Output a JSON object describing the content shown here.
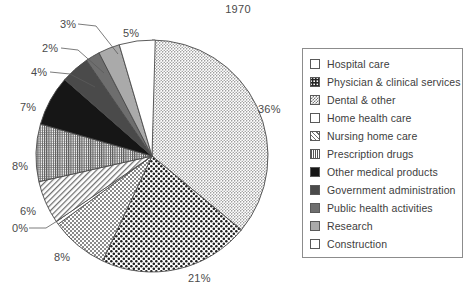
{
  "chart_data": {
    "type": "pie",
    "title": "1970",
    "xlabel": "",
    "ylabel": "",
    "legend_position": "right",
    "grid": false,
    "start_angle_deg": 0,
    "direction": "clockwise",
    "categories": [
      "Hospital care",
      "Physician & clinical services",
      "Dental & other",
      "Home health care",
      "Nursing home care",
      "Prescription drugs",
      "Other medical products",
      "Government administration",
      "Public health activities",
      "Research",
      "Construction"
    ],
    "values": [
      36,
      21,
      8,
      0,
      6,
      8,
      7,
      4,
      2,
      3,
      5
    ],
    "value_labels": [
      "36%",
      "21%",
      "8%",
      "0%",
      "6%",
      "8%",
      "7%",
      "4%",
      "2%",
      "3%",
      "5%"
    ],
    "slices": [
      {
        "label": "Hospital care",
        "value": 36,
        "value_label": "36%",
        "fill": "fine-dots",
        "swatch_class": "sw-fine-dots"
      },
      {
        "label": "Physician & clinical services",
        "value": 21,
        "value_label": "21%",
        "fill": "coarse-dots",
        "swatch_class": "sw-coarse-dots"
      },
      {
        "label": "Dental & other",
        "value": 8,
        "value_label": "8%",
        "fill": "checker",
        "swatch_class": "sw-checker"
      },
      {
        "label": "Home health care",
        "value": 0,
        "value_label": "0%",
        "fill": "plain-white",
        "swatch_class": "sw-plain-white"
      },
      {
        "label": "Nursing home care",
        "value": 6,
        "value_label": "6%",
        "fill": "diagonal",
        "swatch_class": "sw-diagonal"
      },
      {
        "label": "Prescription drugs",
        "value": 8,
        "value_label": "8%",
        "fill": "vlines",
        "swatch_class": "sw-vlines"
      },
      {
        "label": "Other medical products",
        "value": 7,
        "value_label": "7%",
        "fill": "black",
        "swatch_class": "sw-black"
      },
      {
        "label": "Government administration",
        "value": 4,
        "value_label": "4%",
        "fill": "dark-gray",
        "swatch_class": "sw-dark-gray"
      },
      {
        "label": "Public health activities",
        "value": 2,
        "value_label": "2%",
        "fill": "mid-gray",
        "swatch_class": "sw-mid-gray"
      },
      {
        "label": "Research",
        "value": 3,
        "value_label": "3%",
        "fill": "light-gray",
        "swatch_class": "sw-light-gray"
      },
      {
        "label": "Construction",
        "value": 5,
        "value_label": "5%",
        "fill": "plain-white",
        "swatch_class": "sw-plain-white"
      }
    ],
    "colors": {
      "outline": "#4a4a4a",
      "text": "#3d3d3d",
      "legend_border": "#8c8c8c",
      "background": "#ffffff",
      "black_slice": "#161616",
      "dark_gray_slice": "#4a4a4a",
      "mid_gray_slice": "#6e6e6e",
      "light_gray_slice": "#aaaaaa"
    }
  },
  "labels": [
    {
      "text": "36%",
      "left": 258,
      "top": 103
    },
    {
      "text": "21%",
      "left": 188,
      "top": 272
    },
    {
      "text": "8%",
      "left": 54,
      "top": 251
    },
    {
      "text": "0%",
      "left": 12,
      "top": 222
    },
    {
      "text": "6%",
      "left": 20,
      "top": 205
    },
    {
      "text": "8%",
      "left": 12,
      "top": 160
    },
    {
      "text": "7%",
      "left": 20,
      "top": 101
    },
    {
      "text": "4%",
      "left": 31,
      "top": 66
    },
    {
      "text": "2%",
      "left": 42,
      "top": 42
    },
    {
      "text": "3%",
      "left": 60,
      "top": 18
    },
    {
      "text": "5%",
      "left": 123,
      "top": 27
    }
  ]
}
